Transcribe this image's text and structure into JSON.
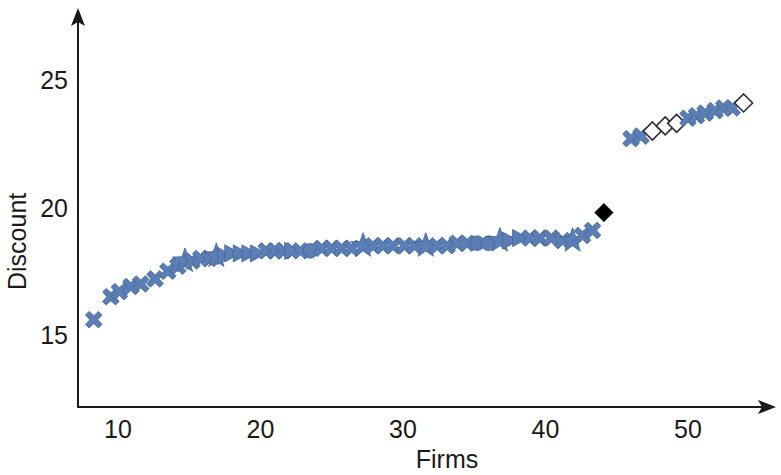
{
  "chart_data": {
    "type": "scatter",
    "title": "",
    "xlabel": "Firms",
    "ylabel": "Discount",
    "xlim": [
      7,
      55.5
    ],
    "ylim": [
      12.5,
      26.5
    ],
    "xticks": [
      10,
      20,
      30,
      40,
      50
    ],
    "xtick_labels": [
      "10",
      "20",
      "30",
      "40",
      "50"
    ],
    "yticks": [
      15,
      20,
      25
    ],
    "ytick_labels": [
      "15",
      "20",
      "25"
    ],
    "grid": false,
    "legend": "none",
    "axis_style": "arrowed-l-shape",
    "marker_color": "#5b7fb5",
    "marker_outline_color": "#42639a",
    "open_marker_color": "#ffffff",
    "open_marker_outline_color": "#2b2b38",
    "highlight_color": "#000000",
    "series": [
      {
        "name": "Firms discount",
        "points": [
          {
            "x": 8.3,
            "y": 15.6,
            "marker": "x",
            "style": "filled"
          },
          {
            "x": 9.5,
            "y": 16.5,
            "marker": "x",
            "style": "filled"
          },
          {
            "x": 10.1,
            "y": 16.7,
            "marker": "x",
            "style": "filled"
          },
          {
            "x": 10.9,
            "y": 16.9,
            "marker": "x",
            "style": "filled"
          },
          {
            "x": 11.6,
            "y": 17.0,
            "marker": "x",
            "style": "filled"
          },
          {
            "x": 12.6,
            "y": 17.2,
            "marker": "x",
            "style": "filled"
          },
          {
            "x": 13.5,
            "y": 17.5,
            "marker": "x",
            "style": "filled"
          },
          {
            "x": 14.2,
            "y": 17.7,
            "marker": "x",
            "style": "filled"
          },
          {
            "x": 14.7,
            "y": 17.9,
            "marker": "star",
            "style": "filled"
          },
          {
            "x": 15.2,
            "y": 17.9,
            "marker": "x",
            "style": "filled"
          },
          {
            "x": 15.8,
            "y": 18.0,
            "marker": "x",
            "style": "filled"
          },
          {
            "x": 16.4,
            "y": 18.0,
            "marker": "x",
            "style": "filled"
          },
          {
            "x": 16.9,
            "y": 18.1,
            "marker": "star",
            "style": "filled"
          },
          {
            "x": 17.5,
            "y": 18.1,
            "marker": "triangle",
            "style": "filled"
          },
          {
            "x": 18.0,
            "y": 18.2,
            "marker": "triangle",
            "style": "filled"
          },
          {
            "x": 18.6,
            "y": 18.2,
            "marker": "triangle",
            "style": "filled"
          },
          {
            "x": 19.2,
            "y": 18.2,
            "marker": "triangle",
            "style": "filled"
          },
          {
            "x": 19.8,
            "y": 18.2,
            "marker": "triangle",
            "style": "filled"
          },
          {
            "x": 20.4,
            "y": 18.3,
            "marker": "x",
            "style": "filled"
          },
          {
            "x": 21.0,
            "y": 18.3,
            "marker": "x",
            "style": "filled"
          },
          {
            "x": 21.6,
            "y": 18.3,
            "marker": "x",
            "style": "filled"
          },
          {
            "x": 22.2,
            "y": 18.3,
            "marker": "triangle",
            "style": "filled"
          },
          {
            "x": 22.8,
            "y": 18.3,
            "marker": "x",
            "style": "filled"
          },
          {
            "x": 23.5,
            "y": 18.3,
            "marker": "circle",
            "style": "filled"
          },
          {
            "x": 24.3,
            "y": 18.4,
            "marker": "x",
            "style": "filled"
          },
          {
            "x": 25.0,
            "y": 18.4,
            "marker": "x",
            "style": "filled"
          },
          {
            "x": 25.7,
            "y": 18.4,
            "marker": "x",
            "style": "filled"
          },
          {
            "x": 26.4,
            "y": 18.4,
            "marker": "x",
            "style": "filled"
          },
          {
            "x": 27.2,
            "y": 18.5,
            "marker": "star",
            "style": "filled"
          },
          {
            "x": 27.9,
            "y": 18.5,
            "marker": "x",
            "style": "filled"
          },
          {
            "x": 28.6,
            "y": 18.5,
            "marker": "x",
            "style": "filled"
          },
          {
            "x": 29.3,
            "y": 18.5,
            "marker": "x",
            "style": "filled"
          },
          {
            "x": 30.1,
            "y": 18.5,
            "marker": "x",
            "style": "filled"
          },
          {
            "x": 30.8,
            "y": 18.5,
            "marker": "x",
            "style": "filled"
          },
          {
            "x": 31.6,
            "y": 18.5,
            "marker": "star",
            "style": "filled"
          },
          {
            "x": 32.4,
            "y": 18.5,
            "marker": "x",
            "style": "filled"
          },
          {
            "x": 33.1,
            "y": 18.5,
            "marker": "x",
            "style": "filled"
          },
          {
            "x": 33.8,
            "y": 18.6,
            "marker": "x",
            "style": "filled"
          },
          {
            "x": 34.5,
            "y": 18.6,
            "marker": "x",
            "style": "filled"
          },
          {
            "x": 35.2,
            "y": 18.6,
            "marker": "circle",
            "style": "filled"
          },
          {
            "x": 36.0,
            "y": 18.6,
            "marker": "circle",
            "style": "filled"
          },
          {
            "x": 36.8,
            "y": 18.7,
            "marker": "star",
            "style": "filled"
          },
          {
            "x": 37.5,
            "y": 18.7,
            "marker": "triangle",
            "style": "filled"
          },
          {
            "x": 38.2,
            "y": 18.8,
            "marker": "triangle",
            "style": "filled"
          },
          {
            "x": 38.9,
            "y": 18.8,
            "marker": "x",
            "style": "filled"
          },
          {
            "x": 39.6,
            "y": 18.8,
            "marker": "x",
            "style": "filled"
          },
          {
            "x": 40.4,
            "y": 18.8,
            "marker": "x",
            "style": "filled"
          },
          {
            "x": 41.2,
            "y": 18.7,
            "marker": "x",
            "style": "filled"
          },
          {
            "x": 41.9,
            "y": 18.7,
            "marker": "star",
            "style": "filled"
          },
          {
            "x": 42.6,
            "y": 18.9,
            "marker": "x",
            "style": "filled"
          },
          {
            "x": 43.3,
            "y": 19.1,
            "marker": "x",
            "style": "filled"
          },
          {
            "x": 44.1,
            "y": 19.8,
            "marker": "diamond",
            "style": "highlight"
          },
          {
            "x": 46.0,
            "y": 22.7,
            "marker": "x",
            "style": "filled"
          },
          {
            "x": 46.7,
            "y": 22.8,
            "marker": "x",
            "style": "filled"
          },
          {
            "x": 47.5,
            "y": 23.0,
            "marker": "diamond",
            "style": "open"
          },
          {
            "x": 48.4,
            "y": 23.2,
            "marker": "diamond",
            "style": "open"
          },
          {
            "x": 49.2,
            "y": 23.3,
            "marker": "diamond",
            "style": "open"
          },
          {
            "x": 50.0,
            "y": 23.5,
            "marker": "x",
            "style": "filled"
          },
          {
            "x": 50.6,
            "y": 23.6,
            "marker": "x",
            "style": "filled"
          },
          {
            "x": 51.2,
            "y": 23.7,
            "marker": "x",
            "style": "filled"
          },
          {
            "x": 51.9,
            "y": 23.8,
            "marker": "x",
            "style": "filled"
          },
          {
            "x": 52.5,
            "y": 23.9,
            "marker": "x",
            "style": "filled"
          },
          {
            "x": 53.1,
            "y": 23.9,
            "marker": "x",
            "style": "filled"
          },
          {
            "x": 53.9,
            "y": 24.1,
            "marker": "diamond",
            "style": "open"
          }
        ]
      }
    ]
  }
}
